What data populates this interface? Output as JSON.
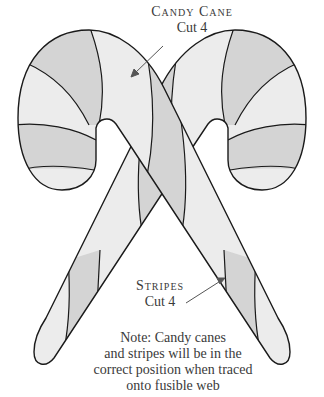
{
  "pattern_title": "Candy cane applique pattern",
  "labels": {
    "candy_cane": {
      "title": "Candy Cane",
      "cut": "Cut 4"
    },
    "stripes": {
      "title": "Stripes",
      "cut": "Cut 4"
    }
  },
  "note": {
    "line1": "Note: Candy canes",
    "line2": "and stripes will be in the",
    "line3": "correct position when traced",
    "line4": "onto fusible web"
  },
  "colors": {
    "cane_fill": "#ececec",
    "stripe_fill": "#d4d4d4",
    "outline": "#1a1a1a",
    "background": "#ffffff"
  }
}
